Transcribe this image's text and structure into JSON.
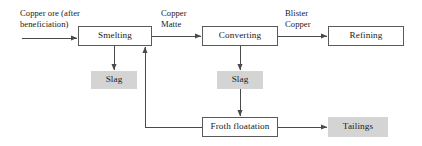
{
  "diagram": {
    "canvas": {
      "width": 422,
      "height": 146,
      "background": "#ffffff"
    },
    "style": {
      "process_fill": "#ffffff",
      "process_stroke": "#5a5a5a",
      "output_fill": "#d4d4d4",
      "line_color": "#4a4a4a",
      "text_color": "#1a1a1a"
    },
    "nodes": [
      {
        "id": "smelting",
        "label": "Smelting",
        "kind": "process",
        "x": 78,
        "y": 26,
        "w": 74,
        "h": 20
      },
      {
        "id": "converting",
        "label": "Converting",
        "kind": "process",
        "x": 202,
        "y": 26,
        "w": 76,
        "h": 20
      },
      {
        "id": "refining",
        "label": "Refining",
        "kind": "process",
        "x": 328,
        "y": 26,
        "w": 76,
        "h": 20
      },
      {
        "id": "slag-smelting",
        "label": "Slag",
        "kind": "output",
        "x": 91,
        "y": 71,
        "w": 46,
        "h": 18
      },
      {
        "id": "slag-converting",
        "label": "Slag",
        "kind": "output",
        "x": 217,
        "y": 71,
        "w": 46,
        "h": 18
      },
      {
        "id": "froth-floatation",
        "label": "Froth floatation",
        "kind": "process",
        "x": 202,
        "y": 117,
        "w": 76,
        "h": 20
      },
      {
        "id": "tailings",
        "label": "Tailings",
        "kind": "output",
        "x": 328,
        "y": 117,
        "w": 60,
        "h": 20
      }
    ],
    "edge_labels": [
      {
        "id": "feed-label",
        "text": "Copper ore (after\nbeneficiation)",
        "x": 20,
        "y": 8,
        "align": "left"
      },
      {
        "id": "matte-label",
        "text": "Copper\nMatte",
        "x": 161,
        "y": 8,
        "align": "left"
      },
      {
        "id": "blister-label",
        "text": "Blister\nCopper",
        "x": 285,
        "y": 8,
        "align": "left"
      }
    ],
    "edges": [
      {
        "id": "ore-to-smelting",
        "from": "copper-ore-input",
        "to": "smelting",
        "label": "Copper ore (after beneficiation)"
      },
      {
        "id": "smelting-to-converting",
        "from": "smelting",
        "to": "converting",
        "label": "Copper Matte"
      },
      {
        "id": "converting-to-refining",
        "from": "converting",
        "to": "refining",
        "label": "Blister Copper"
      },
      {
        "id": "smelting-to-slag",
        "from": "smelting",
        "to": "slag-smelting",
        "label": ""
      },
      {
        "id": "converting-to-slag",
        "from": "converting",
        "to": "slag-converting",
        "label": ""
      },
      {
        "id": "slag-to-froth",
        "from": "slag-converting",
        "to": "froth-floatation",
        "label": ""
      },
      {
        "id": "froth-to-tailings",
        "from": "froth-floatation",
        "to": "tailings",
        "label": ""
      },
      {
        "id": "froth-recycle-smelting",
        "from": "froth-floatation",
        "to": "smelting",
        "label": ""
      }
    ]
  }
}
